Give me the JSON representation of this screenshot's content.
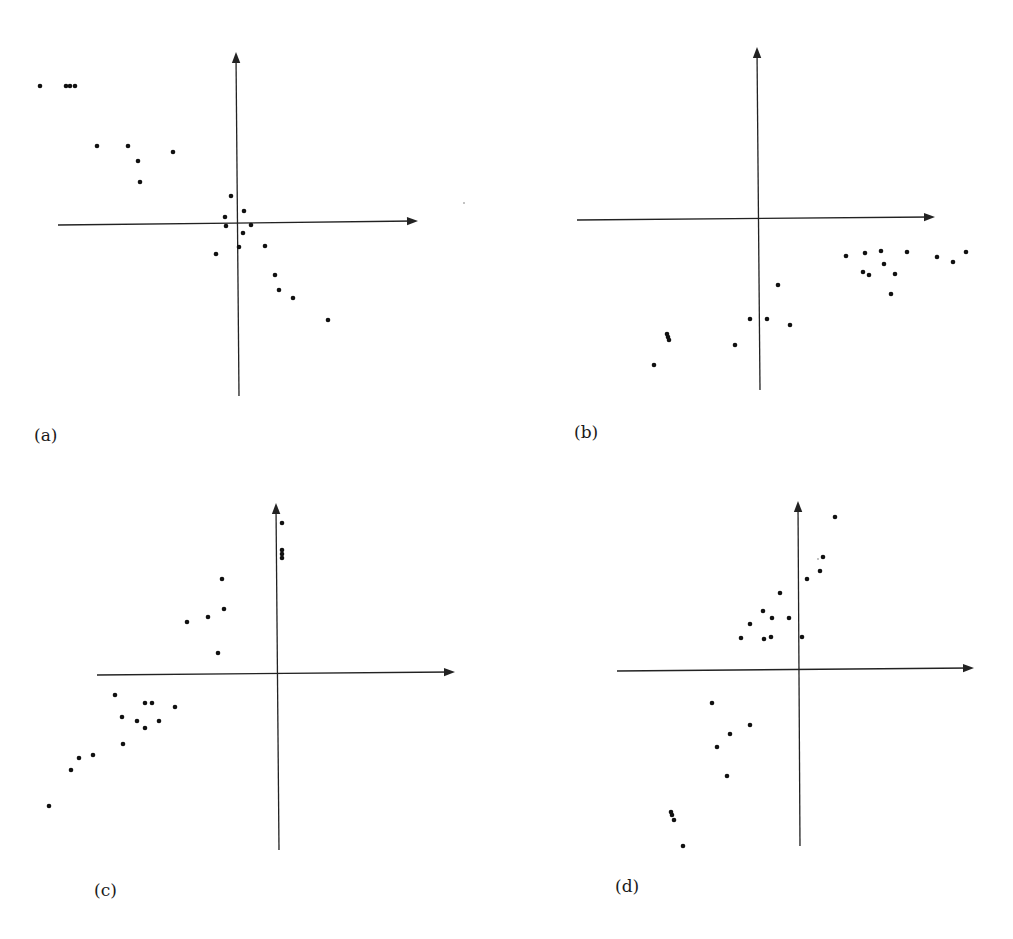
{
  "figure": {
    "width": 1013,
    "height": 939,
    "background": "#ffffff",
    "ink_color": "#111111"
  },
  "chart_data": [
    {
      "type": "scatter",
      "panel": "a",
      "label": "(a)",
      "title": "",
      "xlabel": "",
      "ylabel": "",
      "grid": false,
      "legend": null,
      "axes": {
        "x_from": [
          58,
          225
        ],
        "x_to": [
          418,
          221
        ],
        "y_from": [
          239,
          396
        ],
        "y_to": [
          236,
          52
        ],
        "origin": [
          238,
          223
        ]
      },
      "label_pos": [
        34,
        427
      ],
      "points_px": [
        [
          40,
          86
        ],
        [
          66,
          86
        ],
        [
          70,
          86
        ],
        [
          75,
          86
        ],
        [
          97,
          146
        ],
        [
          128,
          146
        ],
        [
          138,
          161
        ],
        [
          140,
          182
        ],
        [
          173,
          152
        ],
        [
          231,
          196
        ],
        [
          244,
          211
        ],
        [
          225,
          217
        ],
        [
          226,
          226
        ],
        [
          251,
          225
        ],
        [
          243,
          233
        ],
        [
          239,
          247
        ],
        [
          216,
          254
        ],
        [
          265,
          246
        ],
        [
          275,
          275
        ],
        [
          279,
          290
        ],
        [
          293,
          298
        ],
        [
          328,
          320
        ]
      ],
      "stray_marks_px": [
        [
          464,
          203
        ]
      ],
      "description": "Negative correlation: points run from upper-left to lower-right through the origin"
    },
    {
      "type": "scatter",
      "panel": "b",
      "label": "(b)",
      "title": "",
      "xlabel": "",
      "ylabel": "",
      "grid": false,
      "legend": null,
      "axes": {
        "x_from": [
          577,
          220
        ],
        "x_to": [
          935,
          217
        ],
        "y_from": [
          760,
          390
        ],
        "y_to": [
          757,
          47
        ],
        "origin": [
          758,
          219
        ]
      },
      "label_pos": [
        574,
        424
      ],
      "points_px": [
        [
          846,
          256
        ],
        [
          865,
          253
        ],
        [
          881,
          251
        ],
        [
          907,
          252
        ],
        [
          937,
          257
        ],
        [
          953,
          262
        ],
        [
          966,
          252
        ],
        [
          884,
          264
        ],
        [
          863,
          272
        ],
        [
          869,
          275
        ],
        [
          895,
          274
        ],
        [
          891,
          294
        ],
        [
          778,
          285
        ],
        [
          750,
          319
        ],
        [
          767,
          319
        ],
        [
          790,
          325
        ],
        [
          735,
          345
        ],
        [
          667,
          334
        ],
        [
          668,
          337
        ],
        [
          669,
          340
        ],
        [
          654,
          365
        ]
      ],
      "stray_marks_px": [],
      "description": "Positive trend, all points below the x-axis"
    },
    {
      "type": "scatter",
      "panel": "c",
      "label": "(c)",
      "title": "",
      "xlabel": "",
      "ylabel": "",
      "grid": false,
      "legend": null,
      "axes": {
        "x_from": [
          97,
          675
        ],
        "x_to": [
          455,
          672
        ],
        "y_from": [
          279,
          850
        ],
        "y_to": [
          276,
          503
        ],
        "origin": [
          277,
          673
        ]
      },
      "label_pos": [
        94,
        882
      ],
      "points_px": [
        [
          282,
          523
        ],
        [
          282,
          550
        ],
        [
          282,
          554
        ],
        [
          282,
          558
        ],
        [
          222,
          579
        ],
        [
          224,
          609
        ],
        [
          208,
          617
        ],
        [
          187,
          622
        ],
        [
          218,
          653
        ],
        [
          115,
          695
        ],
        [
          145,
          703
        ],
        [
          152,
          703
        ],
        [
          175,
          707
        ],
        [
          122,
          717
        ],
        [
          137,
          721
        ],
        [
          159,
          721
        ],
        [
          145,
          728
        ],
        [
          123,
          744
        ],
        [
          93,
          755
        ],
        [
          79,
          758
        ],
        [
          71,
          770
        ],
        [
          49,
          806
        ]
      ],
      "stray_marks_px": [],
      "description": "Positive trend, nearly all points left of the y-axis"
    },
    {
      "type": "scatter",
      "panel": "d",
      "label": "(d)",
      "title": "",
      "xlabel": "",
      "ylabel": "",
      "grid": false,
      "legend": null,
      "axes": {
        "x_from": [
          617,
          671
        ],
        "x_to": [
          974,
          668
        ],
        "y_from": [
          800,
          846
        ],
        "y_to": [
          798,
          501
        ],
        "origin": [
          799,
          670
        ]
      },
      "label_pos": [
        615,
        878
      ],
      "points_px": [
        [
          835,
          517
        ],
        [
          823,
          557
        ],
        [
          820,
          571
        ],
        [
          807,
          579
        ],
        [
          780,
          593
        ],
        [
          763,
          611
        ],
        [
          772,
          618
        ],
        [
          789,
          618
        ],
        [
          750,
          624
        ],
        [
          741,
          638
        ],
        [
          764,
          639
        ],
        [
          771,
          637
        ],
        [
          802,
          637
        ],
        [
          712,
          703
        ],
        [
          750,
          725
        ],
        [
          730,
          734
        ],
        [
          717,
          747
        ],
        [
          727,
          776
        ],
        [
          671,
          812
        ],
        [
          672,
          815
        ],
        [
          674,
          820
        ],
        [
          683,
          846
        ]
      ],
      "stray_marks_px": [
        [
          818,
          559
        ]
      ],
      "description": "Strong positive correlation through the origin"
    }
  ]
}
